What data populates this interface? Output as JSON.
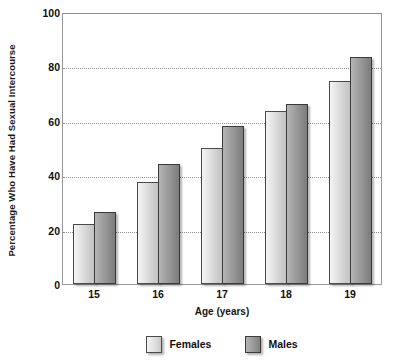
{
  "chart_data": {
    "type": "bar",
    "title": "",
    "xlabel": "Age (years)",
    "ylabel": "Percentage Who Have Had Sexual Intercourse",
    "categories": [
      "15",
      "16",
      "17",
      "18",
      "19"
    ],
    "series": [
      {
        "name": "Females",
        "color": "#dcdcdc",
        "values": [
          22,
          37.5,
          50,
          63.5,
          74.5
        ]
      },
      {
        "name": "Males",
        "color": "#979797",
        "values": [
          26.5,
          44,
          58,
          66,
          83.5
        ]
      }
    ],
    "ylim": [
      0,
      100
    ],
    "yticks": [
      0,
      20,
      40,
      60,
      80,
      100
    ],
    "ytick_labels": [
      "0",
      "20",
      "40",
      "60",
      "80",
      "100"
    ],
    "gridlines": [
      20,
      40,
      60,
      80
    ],
    "grid": true,
    "legend_position": "bottom-center"
  },
  "legend": {
    "items": [
      {
        "label": "Females",
        "swatch": "female-swatch"
      },
      {
        "label": "Males",
        "swatch": "male-swatch"
      }
    ]
  }
}
